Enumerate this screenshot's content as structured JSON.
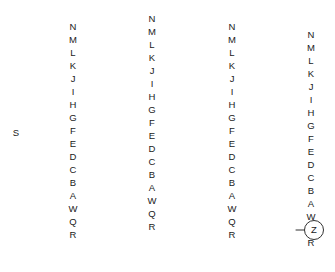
{
  "diagram": {
    "type": "fan-star-graph",
    "canvas": {
      "width": 335,
      "height": 272,
      "background": "#ffffff"
    },
    "line_color": "#1a1a1a",
    "text_color": "#1a1a1a",
    "leaf_labels": [
      "N",
      "M",
      "L",
      "K",
      "J",
      "I",
      "H",
      "G",
      "F",
      "E",
      "D",
      "C",
      "B",
      "A",
      "W",
      "Q",
      "R"
    ],
    "groups": [
      {
        "id": "group-1",
        "vertex_label": "S",
        "vertex_label_visible": true,
        "vertex_x": 31,
        "vertex_y": 133,
        "label_x": 73,
        "label_top_y": 27,
        "label_spacing": 13.0,
        "leaf_labels": [
          "N",
          "M",
          "L",
          "K",
          "J",
          "I",
          "H",
          "G",
          "F",
          "E",
          "D",
          "C",
          "B",
          "A",
          "W",
          "Q",
          "R"
        ]
      },
      {
        "id": "group-2",
        "vertex_label": "",
        "vertex_label_visible": false,
        "vertex_x": 113,
        "vertex_y": 146,
        "label_x": 152,
        "label_top_y": 19,
        "label_spacing": 13.0,
        "leaf_labels": [
          "N",
          "M",
          "L",
          "K",
          "J",
          "I",
          "H",
          "G",
          "F",
          "E",
          "D",
          "C",
          "B",
          "A",
          "W",
          "Q",
          "R"
        ]
      },
      {
        "id": "group-3",
        "vertex_label": "",
        "vertex_label_visible": false,
        "vertex_x": 193,
        "vertex_y": 133,
        "label_x": 232,
        "label_top_y": 27,
        "label_spacing": 13.0,
        "leaf_labels": [
          "N",
          "M",
          "L",
          "K",
          "J",
          "I",
          "H",
          "G",
          "F",
          "E",
          "D",
          "C",
          "B",
          "A",
          "W",
          "Q",
          "R"
        ]
      },
      {
        "id": "group-4",
        "vertex_label": "",
        "vertex_label_visible": false,
        "vertex_x": 271,
        "vertex_y": 141,
        "label_x": 311,
        "label_top_y": 35,
        "label_spacing": 13.0,
        "leaf_labels": [
          "N",
          "M",
          "L",
          "K",
          "J",
          "I",
          "H",
          "G",
          "F",
          "E",
          "D",
          "C",
          "B",
          "A",
          "W",
          "Q",
          "R"
        ]
      }
    ],
    "sink_node": {
      "label": "Z",
      "cx": 314,
      "cy": 230,
      "r": 9.5,
      "connector_from_x": 296,
      "connector_to_x": 304,
      "connector_y": 230,
      "attached_to_leaf": "W"
    }
  }
}
